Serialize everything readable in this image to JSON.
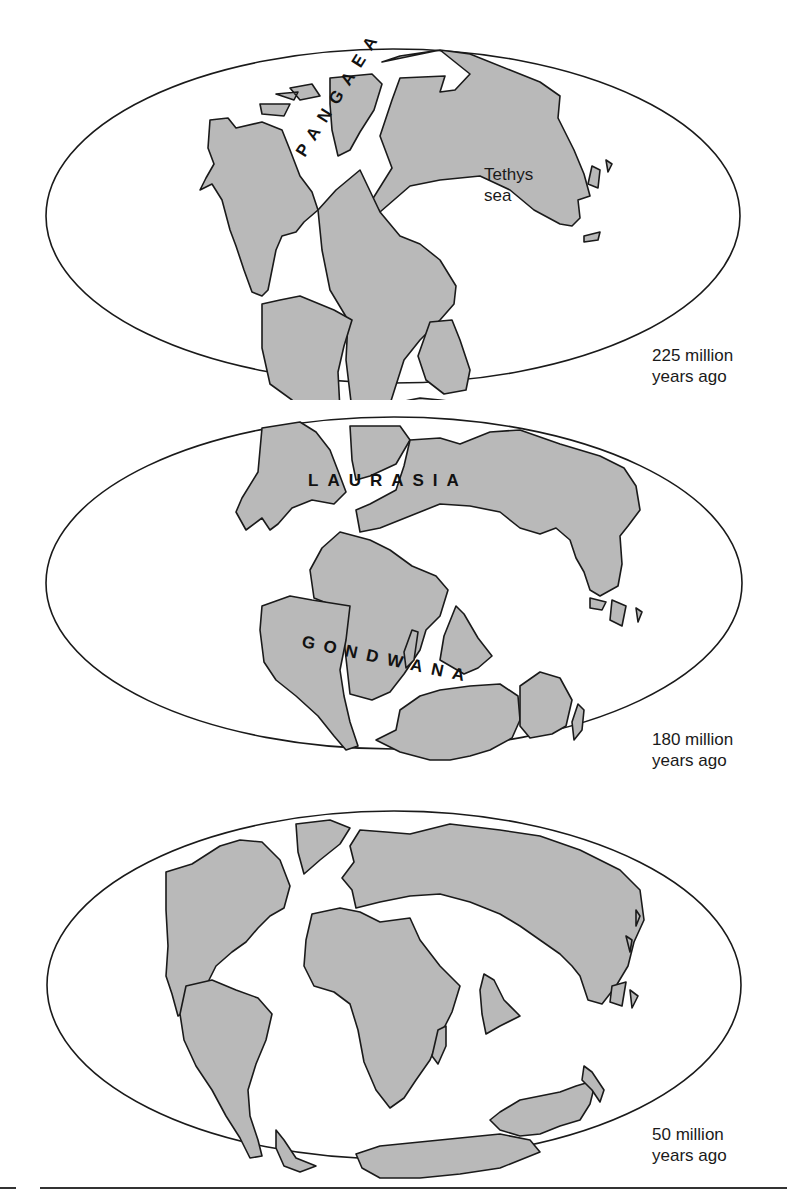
{
  "figure": {
    "panels": [
      {
        "era": "225 million years ago",
        "era_line1": "225 million",
        "era_line2": "years ago",
        "labels": {
          "supercontinent": "PANGAEA",
          "sea_line1": "Tethys",
          "sea_line2": "sea"
        }
      },
      {
        "era": "180 million years ago",
        "era_line1": "180 million",
        "era_line2": "years ago",
        "labels": {
          "north": "LAURASIA",
          "south": "GONDWANA"
        }
      },
      {
        "era": "50 million years ago",
        "era_line1": "50 million",
        "era_line2": "years ago",
        "labels": {}
      }
    ],
    "colors": {
      "land": "#b9b9b9",
      "outline": "#1a1a1a",
      "ocean": "#ffffff"
    }
  }
}
